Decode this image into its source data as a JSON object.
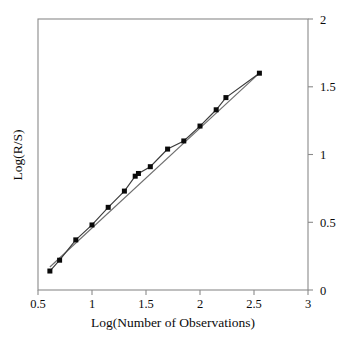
{
  "chart_data": {
    "type": "scatter",
    "title": "",
    "subtitle": "",
    "xlabel": "Log(Number of Observations)",
    "ylabel": "Log(R/S)",
    "xlim": [
      0.5,
      3
    ],
    "ylim": [
      0,
      2
    ],
    "xticks": [
      "0.5",
      "1",
      "1.5",
      "2",
      "2.5",
      "3"
    ],
    "xtick_values": [
      0.5,
      1,
      1.5,
      2,
      2.5,
      3
    ],
    "yticks": [
      "0",
      "0.5",
      "1",
      "1.5",
      "2"
    ],
    "ytick_values": [
      0,
      0.5,
      1,
      1.5,
      2
    ],
    "y_axis_position": "right",
    "grid": false,
    "legend": null,
    "marker_style": "filled-square",
    "annotations": [],
    "series": [
      {
        "name": "R/S observations",
        "marker": "filled-square",
        "line": true,
        "x": [
          0.61,
          0.7,
          0.85,
          1.0,
          1.15,
          1.3,
          1.4,
          1.43,
          1.54,
          1.7,
          1.85,
          2.0,
          2.15,
          2.24,
          2.55
        ],
        "y": [
          0.14,
          0.22,
          0.37,
          0.48,
          0.61,
          0.73,
          0.84,
          0.86,
          0.91,
          1.04,
          1.1,
          1.21,
          1.33,
          1.42,
          1.6
        ]
      },
      {
        "name": "Least-squares fit",
        "marker": "none",
        "line": true,
        "x": [
          0.61,
          2.55
        ],
        "y": [
          0.17,
          1.6
        ]
      }
    ],
    "colors": {
      "marker": "#0a0a0a",
      "series_line": "#3a3a3a",
      "fit_line": "#6e6e6e",
      "axis": "#8a8a8a",
      "text": "#0b0b0b",
      "background": "#ffffff"
    }
  },
  "axes": {
    "x_title": "Log(Number of Observations)",
    "y_title": "Log(R/S)",
    "x_tick_labels": [
      "0.5",
      "1",
      "1.5",
      "2",
      "2.5",
      "3"
    ],
    "y_tick_labels": [
      "0",
      "0.5",
      "1",
      "1.5",
      "2"
    ]
  }
}
